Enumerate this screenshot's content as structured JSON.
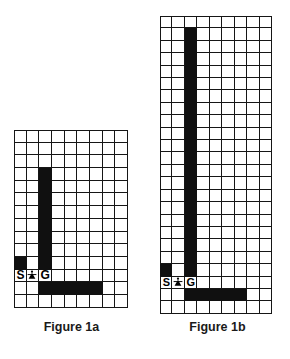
{
  "figures": [
    {
      "id": "figure-1a",
      "caption": "Figure 1a",
      "cols": 9,
      "rows": 14,
      "start_label": "S",
      "goal_label": "G",
      "robot_icon": "robot-icon",
      "start_cell": {
        "col": 0,
        "row": 11
      },
      "robot_cell": {
        "col": 1,
        "row": 11
      },
      "goal_cell": {
        "col": 2,
        "row": 11
      },
      "walls": [
        {
          "col": 2,
          "row": 3
        },
        {
          "col": 2,
          "row": 4
        },
        {
          "col": 2,
          "row": 5
        },
        {
          "col": 2,
          "row": 6
        },
        {
          "col": 2,
          "row": 7
        },
        {
          "col": 2,
          "row": 8
        },
        {
          "col": 2,
          "row": 9
        },
        {
          "col": 2,
          "row": 10
        },
        {
          "col": 0,
          "row": 10
        },
        {
          "col": 2,
          "row": 12
        },
        {
          "col": 3,
          "row": 12
        },
        {
          "col": 4,
          "row": 12
        },
        {
          "col": 5,
          "row": 12
        },
        {
          "col": 6,
          "row": 12
        }
      ]
    },
    {
      "id": "figure-1b",
      "caption": "Figure 1b",
      "cols": 9,
      "rows": 24,
      "start_label": "S",
      "goal_label": "G",
      "robot_icon": "robot-icon",
      "start_cell": {
        "col": 0,
        "row": 21
      },
      "robot_cell": {
        "col": 1,
        "row": 21
      },
      "goal_cell": {
        "col": 2,
        "row": 21
      },
      "walls": [
        {
          "col": 2,
          "row": 1
        },
        {
          "col": 2,
          "row": 2
        },
        {
          "col": 2,
          "row": 3
        },
        {
          "col": 2,
          "row": 4
        },
        {
          "col": 2,
          "row": 5
        },
        {
          "col": 2,
          "row": 6
        },
        {
          "col": 2,
          "row": 7
        },
        {
          "col": 2,
          "row": 8
        },
        {
          "col": 2,
          "row": 9
        },
        {
          "col": 2,
          "row": 10
        },
        {
          "col": 2,
          "row": 11
        },
        {
          "col": 2,
          "row": 12
        },
        {
          "col": 2,
          "row": 13
        },
        {
          "col": 2,
          "row": 14
        },
        {
          "col": 2,
          "row": 15
        },
        {
          "col": 2,
          "row": 16
        },
        {
          "col": 2,
          "row": 17
        },
        {
          "col": 2,
          "row": 18
        },
        {
          "col": 2,
          "row": 19
        },
        {
          "col": 2,
          "row": 20
        },
        {
          "col": 0,
          "row": 20
        },
        {
          "col": 2,
          "row": 22
        },
        {
          "col": 3,
          "row": 22
        },
        {
          "col": 4,
          "row": 22
        },
        {
          "col": 5,
          "row": 22
        },
        {
          "col": 6,
          "row": 22
        }
      ]
    }
  ],
  "colors": {
    "wall": "#101010",
    "grid_line": "#161616",
    "free_cell": "#ffffff",
    "background": "#ffffff",
    "text": "#000000"
  }
}
